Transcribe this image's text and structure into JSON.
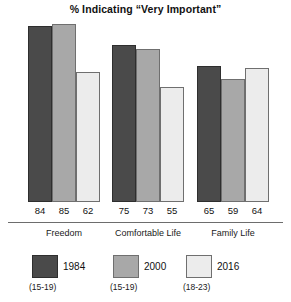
{
  "chart_data": {
    "type": "bar",
    "title": "% Indicating “Very Important”",
    "xlabel": "",
    "ylabel": "",
    "ylim": [
      0,
      88
    ],
    "grid": false,
    "legend_position": "bottom",
    "categories": [
      "Freedom",
      "Comfortable Life",
      "Family Life"
    ],
    "series": [
      {
        "name": "1984",
        "age_range": "(15-19)",
        "color": "#4a4a4a",
        "values": [
          84,
          75,
          65
        ]
      },
      {
        "name": "2000",
        "age_range": "(15-19)",
        "color": "#a8a8a8",
        "values": [
          85,
          73,
          59
        ]
      },
      {
        "name": "2016",
        "age_range": "(18-23)",
        "color": "#ececec",
        "values": [
          62,
          55,
          64
        ]
      }
    ]
  },
  "title": "% Indicating “Very Important”",
  "groups": [
    {
      "label": "Freedom",
      "values": [
        "84",
        "85",
        "62"
      ]
    },
    {
      "label": "Comfortable Life",
      "values": [
        "75",
        "73",
        "55"
      ]
    },
    {
      "label": "Family Life",
      "values": [
        "65",
        "59",
        "64"
      ]
    }
  ],
  "legend": [
    {
      "year": "1984",
      "age": "(15-19)",
      "swatch": "dark-gray-swatch"
    },
    {
      "year": "2000",
      "age": "(15-19)",
      "swatch": "medium-gray-swatch"
    },
    {
      "year": "2016",
      "age": "(18-23)",
      "swatch": "light-gray-swatch"
    }
  ]
}
